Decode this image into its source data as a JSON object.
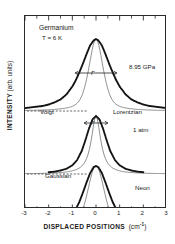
{
  "figure": {
    "sample_label": "Germanium",
    "temperature_label": "T = 6 K",
    "yaxis_title": "INTENSITY",
    "yaxis_units": "(arb. units)",
    "xaxis_title": "DISPLACED POSITIONS",
    "xaxis_units": "cm",
    "xaxis_units_exp": "-1",
    "width_symbol": "Γ"
  },
  "annotations": {
    "top_pressure": "8.95 GPa",
    "middle_pressure": "1 atm",
    "bottom_label": "Neon",
    "profile_voigt": "Voigt",
    "profile_lorentzian": "Lorentzian",
    "profile_gaussian": "Gaussian"
  },
  "chart_data": {
    "type": "line",
    "title": "Germanium",
    "subtitle": "T = 6 K",
    "xlabel": "DISPLACED POSITIONS (cm-1)",
    "ylabel": "INTENSITY (arb. units)",
    "xlim": [
      -3,
      3
    ],
    "xticks": [
      -3,
      -2,
      -1,
      0,
      1,
      2,
      3
    ],
    "grid": false,
    "legend": "inline-annotations",
    "series": [
      {
        "name": "8.95 GPa data",
        "style": "thick-dotted-markers",
        "fit": "Voigt",
        "width_gamma": 0.72,
        "peak_center": 0.0,
        "x": [
          -3.0,
          -2.75,
          -2.5,
          -2.25,
          -2.0,
          -1.75,
          -1.5,
          -1.25,
          -1.0,
          -0.85,
          -0.7,
          -0.55,
          -0.4,
          -0.25,
          -0.1,
          0.0,
          0.1,
          0.25,
          0.4,
          0.55,
          0.7,
          0.85,
          1.0,
          1.25,
          1.5,
          1.75,
          2.0,
          2.25,
          2.5,
          2.75,
          3.0
        ],
        "y": [
          0.04,
          0.05,
          0.06,
          0.07,
          0.09,
          0.12,
          0.16,
          0.23,
          0.34,
          0.43,
          0.54,
          0.66,
          0.79,
          0.91,
          0.98,
          1.0,
          0.98,
          0.91,
          0.79,
          0.66,
          0.54,
          0.43,
          0.34,
          0.23,
          0.16,
          0.12,
          0.09,
          0.07,
          0.06,
          0.05,
          0.04
        ]
      },
      {
        "name": "1 atm data",
        "style": "thick-dotted-markers",
        "fit": "Lorentzian",
        "width_gamma": 0.48,
        "peak_center": 0.0,
        "x": [
          -2.0,
          -1.75,
          -1.5,
          -1.25,
          -1.0,
          -0.8,
          -0.6,
          -0.45,
          -0.3,
          -0.15,
          0.0,
          0.15,
          0.3,
          0.45,
          0.6,
          0.8,
          1.0,
          1.25,
          1.5,
          1.75,
          2.0
        ],
        "y": [
          0.03,
          0.04,
          0.06,
          0.09,
          0.15,
          0.24,
          0.4,
          0.58,
          0.78,
          0.94,
          1.0,
          0.94,
          0.78,
          0.58,
          0.4,
          0.24,
          0.15,
          0.09,
          0.06,
          0.04,
          0.03
        ]
      },
      {
        "name": "Neon data",
        "style": "thick-dotted-markers",
        "fit": "Gaussian",
        "peak_center": 0.0,
        "x": [
          -2.0,
          -1.75,
          -1.5,
          -1.25,
          -1.0,
          -0.85,
          -0.7,
          -0.55,
          -0.4,
          -0.25,
          -0.1,
          0.0,
          0.1,
          0.25,
          0.4,
          0.55,
          0.7,
          0.85,
          1.0,
          1.25,
          1.5,
          1.75,
          2.0
        ],
        "y": [
          0.01,
          0.02,
          0.03,
          0.06,
          0.13,
          0.22,
          0.35,
          0.52,
          0.7,
          0.87,
          0.98,
          1.0,
          0.98,
          0.87,
          0.7,
          0.52,
          0.35,
          0.22,
          0.13,
          0.06,
          0.03,
          0.02,
          0.01
        ]
      }
    ]
  }
}
